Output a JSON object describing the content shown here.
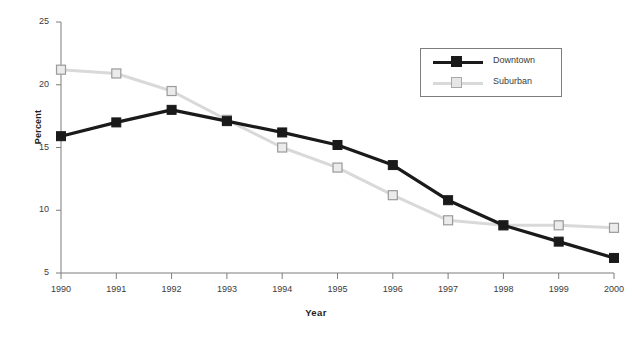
{
  "chart_data": {
    "type": "line",
    "title": "",
    "xlabel": "Year",
    "ylabel": "Percent",
    "categories": [
      "1990",
      "1991",
      "1992",
      "1993",
      "1994",
      "1995",
      "1996",
      "1997",
      "1998",
      "1999",
      "2000"
    ],
    "x": [
      1990,
      1991,
      1992,
      1993,
      1994,
      1995,
      1996,
      1997,
      1998,
      1999,
      2000
    ],
    "xlim": [
      1990,
      2000
    ],
    "ylim": [
      5,
      25
    ],
    "yticks": [
      5,
      10,
      15,
      20,
      25
    ],
    "ytick_labels": [
      "5",
      "10",
      "15",
      "20",
      "25"
    ],
    "grid": false,
    "legend_position": "upper right",
    "series": [
      {
        "name": "Downtown",
        "color": "#1a1a1a",
        "marker": "filled-square",
        "values": [
          15.9,
          17.0,
          18.0,
          17.1,
          16.2,
          15.2,
          13.6,
          10.8,
          8.8,
          7.5,
          6.2
        ]
      },
      {
        "name": "Suburban",
        "color": "#d9d9d9",
        "marker": "open-square",
        "values": [
          21.2,
          20.9,
          19.5,
          17.2,
          15.0,
          13.4,
          11.2,
          9.2,
          8.8,
          8.8,
          8.6
        ]
      }
    ]
  },
  "axes": {
    "y_title": "Percent",
    "x_title": "Year"
  },
  "legend": {
    "entries": [
      {
        "label": "Downtown"
      },
      {
        "label": "Suburban"
      }
    ]
  },
  "colors": {
    "downtown": "#1a1a1a",
    "suburban": "#d9d9d9",
    "axis": "#7d7d7d",
    "text": "#3b3b3b",
    "marker_edge": "#9a9a9a"
  }
}
